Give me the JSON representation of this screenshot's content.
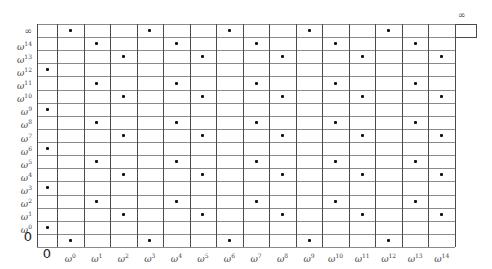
{
  "row_labels": [
    {
      "base": "∞",
      "exp": ""
    },
    {
      "base": "ω",
      "exp": "14"
    },
    {
      "base": "ω",
      "exp": "13"
    },
    {
      "base": "ω",
      "exp": "12"
    },
    {
      "base": "ω",
      "exp": "11"
    },
    {
      "base": "ω",
      "exp": "10"
    },
    {
      "base": "ω",
      "exp": "9"
    },
    {
      "base": "ω",
      "exp": "8"
    },
    {
      "base": "ω",
      "exp": "7"
    },
    {
      "base": "ω",
      "exp": "6"
    },
    {
      "base": "ω",
      "exp": "5"
    },
    {
      "base": "ω",
      "exp": "4"
    },
    {
      "base": "ω",
      "exp": "3"
    },
    {
      "base": "ω",
      "exp": "2"
    },
    {
      "base": "ω",
      "exp": "1"
    },
    {
      "base": "ω",
      "exp": "0"
    },
    {
      "base": "0",
      "exp": ""
    }
  ],
  "col_labels": [
    {
      "base": "0",
      "exp": ""
    },
    {
      "base": "ω",
      "exp": "0"
    },
    {
      "base": "ω",
      "exp": "1"
    },
    {
      "base": "ω",
      "exp": "2"
    },
    {
      "base": "ω",
      "exp": "3"
    },
    {
      "base": "ω",
      "exp": "4"
    },
    {
      "base": "ω",
      "exp": "5"
    },
    {
      "base": "ω",
      "exp": "6"
    },
    {
      "base": "ω",
      "exp": "7"
    },
    {
      "base": "ω",
      "exp": "8"
    },
    {
      "base": "ω",
      "exp": "9"
    },
    {
      "base": "ω",
      "exp": "10"
    },
    {
      "base": "ω",
      "exp": "11"
    },
    {
      "base": "ω",
      "exp": "12"
    },
    {
      "base": "ω",
      "exp": "13"
    },
    {
      "base": "ω",
      "exp": "14"
    }
  ],
  "extra_column_label": "∞",
  "dots": {
    "∞": [
      "ω0",
      "ω3",
      "ω6",
      "ω9",
      "ω12"
    ],
    "ω14": [
      "ω1",
      "ω4",
      "ω7",
      "ω10",
      "ω13"
    ],
    "ω13": [
      "ω2",
      "ω5",
      "ω8",
      "ω11",
      "ω14"
    ],
    "ω12": [
      "0"
    ],
    "ω11": [
      "ω1",
      "ω4",
      "ω7",
      "ω10",
      "ω13"
    ],
    "ω10": [
      "ω2",
      "ω5",
      "ω8",
      "ω11",
      "ω14"
    ],
    "ω9": [
      "0"
    ],
    "ω8": [
      "ω1",
      "ω4",
      "ω7",
      "ω10",
      "ω13"
    ],
    "ω7": [
      "ω2",
      "ω5",
      "ω8",
      "ω11",
      "ω14"
    ],
    "ω6": [
      "0"
    ],
    "ω5": [
      "ω1",
      "ω4",
      "ω7",
      "ω10",
      "ω13"
    ],
    "ω4": [
      "ω2",
      "ω5",
      "ω8",
      "ω11",
      "ω14"
    ],
    "ω3": [
      "0"
    ],
    "ω2": [
      "ω1",
      "ω4",
      "ω7",
      "ω10",
      "ω13"
    ],
    "ω1": [
      "ω2",
      "ω5",
      "ω8",
      "ω11",
      "ω14"
    ],
    "ω0": [
      "0"
    ],
    "0": [
      "ω0",
      "ω3",
      "ω6",
      "ω9",
      "ω12"
    ]
  },
  "colors": {
    "vline": "#4a4a4a",
    "hline": "#8a8a8a",
    "dot": "#111111",
    "label": "#444444"
  }
}
